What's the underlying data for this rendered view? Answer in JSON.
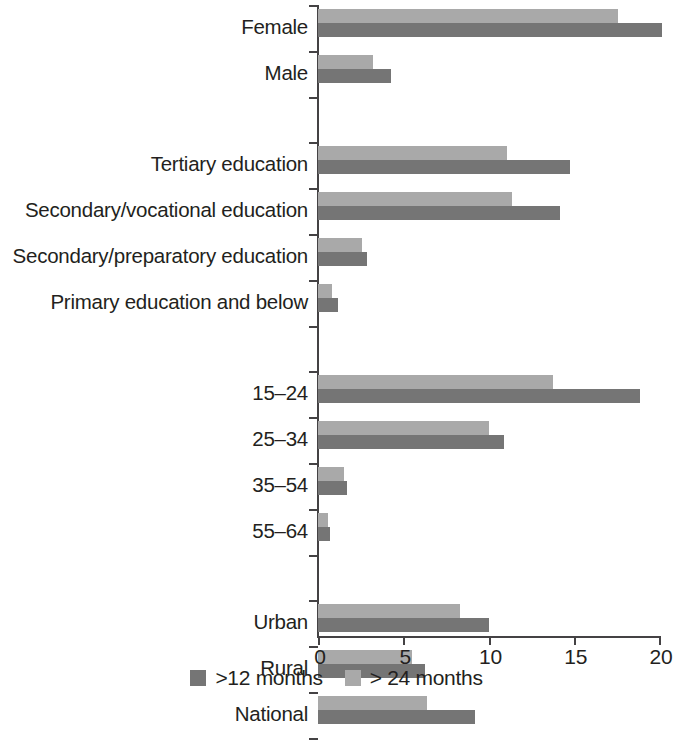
{
  "chart_data": {
    "type": "bar",
    "orientation": "horizontal",
    "title": "",
    "subtitle": "",
    "xlabel": "",
    "ylabel": "",
    "xlim": [
      0,
      20
    ],
    "xticks": [
      0,
      5,
      10,
      15,
      20
    ],
    "xtick_labels": [
      "0",
      "5",
      "10",
      "15",
      "20"
    ],
    "grid": false,
    "legend_position": "bottom-center",
    "categories": [
      "Female",
      "Male",
      "",
      "Tertiary education",
      "Secondary/vocational education",
      "Secondary/preparatory education",
      "Primary education and below",
      "",
      "15–24",
      "25–34",
      "35–54",
      "55–64",
      "",
      "Urban",
      "Rural",
      "National"
    ],
    "series": [
      {
        "name": ">12 months",
        "color": "#757575",
        "values": [
          20.2,
          4.3,
          null,
          14.8,
          14.2,
          2.9,
          1.2,
          null,
          18.9,
          10.9,
          1.7,
          0.7,
          null,
          10.0,
          6.3,
          9.2
        ]
      },
      {
        "name": "> 24 months",
        "color": "#a9a9a9",
        "values": [
          17.6,
          3.2,
          null,
          11.1,
          11.4,
          2.6,
          0.8,
          null,
          13.8,
          10.0,
          1.5,
          0.6,
          null,
          8.3,
          5.5,
          6.4
        ]
      }
    ],
    "legend": [
      {
        "label": ">12 months",
        "color": "#757575"
      },
      {
        "label": "> 24 months",
        "color": "#a9a9a9"
      }
    ]
  },
  "axis": {
    "tick_color": "#444244"
  }
}
